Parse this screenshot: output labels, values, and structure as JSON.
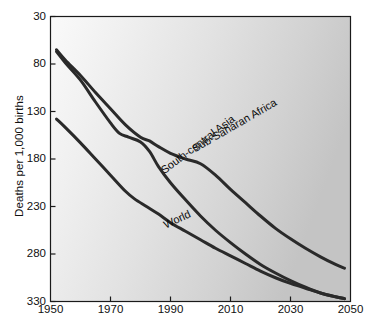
{
  "chart_data": {
    "type": "line",
    "title": "",
    "xlabel": "",
    "ylabel": "Deaths per 1,000 births",
    "xlim": [
      1950,
      2050
    ],
    "ylim": [
      30,
      330
    ],
    "xticks": [
      1950,
      1970,
      1990,
      2010,
      2030,
      2050
    ],
    "yticks": [
      30,
      80,
      130,
      180,
      230,
      280,
      330
    ],
    "grid": false,
    "legend_position": "inline-on-curves",
    "plot_background": "light-to-dark-gray-gradient",
    "line_color": "#2a2a2a",
    "series": [
      {
        "name": "Sub-Saharan Africa",
        "label_rotation_deg": -30,
        "x": [
          1952,
          1955,
          1960,
          1965,
          1970,
          1975,
          1980,
          1983,
          1986,
          1990,
          1995,
          2000,
          2005,
          2010,
          2015,
          2020,
          2025,
          2030,
          2035,
          2040,
          2045,
          2048
        ],
        "values": [
          295,
          284,
          268,
          250,
          233,
          216,
          203,
          199,
          193,
          186,
          180,
          175,
          163,
          148,
          134,
          120,
          107,
          96,
          86,
          77,
          69,
          65
        ]
      },
      {
        "name": "South-central Asia",
        "label_rotation_deg": -37,
        "x": [
          1952,
          1955,
          1960,
          1965,
          1970,
          1973,
          1976,
          1980,
          1983,
          1986,
          1990,
          1995,
          2000,
          2005,
          2010,
          2015,
          2020,
          2025,
          2030,
          2035,
          2040,
          2045,
          2048
        ],
        "values": [
          293,
          281,
          263,
          240,
          218,
          207,
          203,
          198,
          188,
          172,
          155,
          137,
          120,
          105,
          92,
          80,
          69,
          60,
          52,
          45,
          39,
          35,
          33
        ]
      },
      {
        "name": "World",
        "label_rotation_deg": -25,
        "x": [
          1952,
          1955,
          1960,
          1965,
          1970,
          1975,
          1978,
          1982,
          1986,
          1990,
          1995,
          2000,
          2005,
          2010,
          2015,
          2020,
          2025,
          2030,
          2035,
          2040,
          2045,
          2048
        ],
        "values": [
          222,
          213,
          197,
          180,
          163,
          146,
          138,
          130,
          122,
          113,
          104,
          95,
          86,
          78,
          70,
          62,
          55,
          49,
          44,
          39,
          35,
          33
        ]
      }
    ]
  },
  "axis": {
    "y_title": "Deaths per 1,000 births",
    "y_tick_labels": [
      "330",
      "280",
      "230",
      "180",
      "130",
      "80",
      "30"
    ],
    "x_tick_labels": [
      "1950",
      "1970",
      "1990",
      "2010",
      "2030",
      "2050"
    ]
  }
}
